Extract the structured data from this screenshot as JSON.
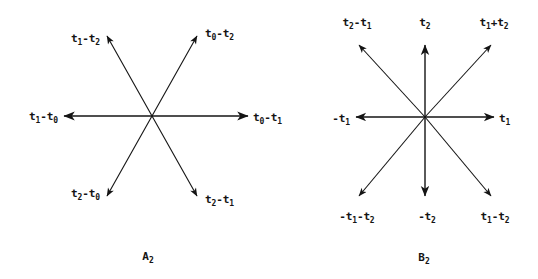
{
  "figure": {
    "background_color": "#ffffff",
    "ink_color": "#141414",
    "diagrams": [
      {
        "id": "A2",
        "caption": "A",
        "caption_sub": "2",
        "caption_full": "A₂",
        "type": "root-system-hexagonal",
        "center": {
          "x": 152,
          "y": 116
        },
        "root_count": 6,
        "roots": [
          {
            "name": "t0-t1",
            "base": "t",
            "sub1": "0",
            "op": "-",
            "base2": "t",
            "sub2": "1",
            "angle_deg": 0,
            "label_pos": "east",
            "tip": {
              "x": 251,
              "y": 116
            }
          },
          {
            "name": "t0-t2",
            "base": "t",
            "sub1": "0",
            "op": "-",
            "base2": "t",
            "sub2": "2",
            "angle_deg": 60,
            "label_pos": "north-east",
            "tip": {
              "x": 199,
              "y": 33
            }
          },
          {
            "name": "t1-t2",
            "base": "t",
            "sub1": "1",
            "op": "-",
            "base2": "t",
            "sub2": "2",
            "angle_deg": 120,
            "label_pos": "north-west",
            "tip": {
              "x": 105,
              "y": 33
            }
          },
          {
            "name": "t1-t0",
            "base": "t",
            "sub1": "1",
            "op": "-",
            "base2": "t",
            "sub2": "0",
            "angle_deg": 180,
            "label_pos": "west",
            "tip": {
              "x": 61,
              "y": 116
            }
          },
          {
            "name": "t2-t0",
            "base": "t",
            "sub1": "2",
            "op": "-",
            "base2": "t",
            "sub2": "0",
            "angle_deg": 240,
            "label_pos": "south-west",
            "tip": {
              "x": 105,
              "y": 199
            }
          },
          {
            "name": "t2-t1",
            "base": "t",
            "sub1": "2",
            "op": "-",
            "base2": "t",
            "sub2": "1",
            "angle_deg": 300,
            "label_pos": "south-east",
            "tip": {
              "x": 199,
              "y": 199
            }
          }
        ]
      },
      {
        "id": "B2",
        "caption": "B",
        "caption_sub": "2",
        "caption_full": "B₂",
        "type": "root-system-square",
        "center": {
          "x": 425,
          "y": 117
        },
        "root_count": 8,
        "roots": [
          {
            "name": "t1",
            "text_prefix": "",
            "base": "t",
            "sub1": "1",
            "op": "",
            "base2": "",
            "sub2": "",
            "angle_deg": 0,
            "label_pos": "east",
            "tip": {
              "x": 497,
              "y": 117
            }
          },
          {
            "name": "t1+t2",
            "text_prefix": "",
            "base": "t",
            "sub1": "1",
            "op": "+",
            "base2": "t",
            "sub2": "2",
            "angle_deg": 45,
            "label_pos": "north-east",
            "tip": {
              "x": 494,
              "y": 42
            }
          },
          {
            "name": "t2",
            "text_prefix": "",
            "base": "t",
            "sub1": "2",
            "op": "",
            "base2": "",
            "sub2": "",
            "angle_deg": 90,
            "label_pos": "north",
            "tip": {
              "x": 425,
              "y": 42
            }
          },
          {
            "name": "t2-t1",
            "text_prefix": "",
            "base": "t",
            "sub1": "2",
            "op": "-",
            "base2": "t",
            "sub2": "1",
            "angle_deg": 135,
            "label_pos": "north-west",
            "tip": {
              "x": 356,
              "y": 42
            }
          },
          {
            "name": "-t1",
            "text_prefix": "-",
            "base": "t",
            "sub1": "1",
            "op": "",
            "base2": "",
            "sub2": "",
            "angle_deg": 180,
            "label_pos": "west",
            "tip": {
              "x": 353,
              "y": 117
            }
          },
          {
            "name": "-t1-t2",
            "text_prefix": "-",
            "base": "t",
            "sub1": "1",
            "op": "-",
            "base2": "t",
            "sub2": "2",
            "angle_deg": 225,
            "label_pos": "south-west",
            "tip": {
              "x": 356,
              "y": 199
            }
          },
          {
            "name": "-t2",
            "text_prefix": "-",
            "base": "t",
            "sub1": "2",
            "op": "",
            "base2": "",
            "sub2": "",
            "angle_deg": 270,
            "label_pos": "south",
            "tip": {
              "x": 425,
              "y": 199
            }
          },
          {
            "name": "t1-t2",
            "text_prefix": "",
            "base": "t",
            "sub1": "1",
            "op": "-",
            "base2": "t",
            "sub2": "2",
            "angle_deg": 315,
            "label_pos": "south-east",
            "tip": {
              "x": 494,
              "y": 199
            }
          }
        ]
      }
    ]
  },
  "a2": {
    "caption_base": "A",
    "caption_sub": "2",
    "labels": {
      "t0_minus_t1": {
        "p1": "t",
        "s1": "0",
        "op": "-",
        "p2": "t",
        "s2": "1"
      },
      "t0_minus_t2": {
        "p1": "t",
        "s1": "0",
        "op": "-",
        "p2": "t",
        "s2": "2"
      },
      "t1_minus_t2": {
        "p1": "t",
        "s1": "1",
        "op": "-",
        "p2": "t",
        "s2": "2"
      },
      "t1_minus_t0": {
        "p1": "t",
        "s1": "1",
        "op": "-",
        "p2": "t",
        "s2": "0"
      },
      "t2_minus_t0": {
        "p1": "t",
        "s1": "2",
        "op": "-",
        "p2": "t",
        "s2": "0"
      },
      "t2_minus_t1": {
        "p1": "t",
        "s1": "2",
        "op": "-",
        "p2": "t",
        "s2": "1"
      }
    }
  },
  "b2": {
    "caption_base": "B",
    "caption_sub": "2",
    "labels": {
      "t1": {
        "p1": "t",
        "s1": "1",
        "op": "",
        "p2": "",
        "s2": ""
      },
      "t1_plus_t2": {
        "p1": "t",
        "s1": "1",
        "op": "+",
        "p2": "t",
        "s2": "2"
      },
      "t2": {
        "p1": "t",
        "s1": "2",
        "op": "",
        "p2": "",
        "s2": ""
      },
      "t2_minus_t1": {
        "p1": "t",
        "s1": "2",
        "op": "-",
        "p2": "t",
        "s2": "1"
      },
      "neg_t1": {
        "p1": "-t",
        "s1": "1",
        "op": "",
        "p2": "",
        "s2": ""
      },
      "neg_t1_neg_t2": {
        "p1": "-t",
        "s1": "1",
        "op": "-",
        "p2": "t",
        "s2": "2"
      },
      "neg_t2": {
        "p1": "-t",
        "s1": "2",
        "op": "",
        "p2": "",
        "s2": ""
      },
      "t1_minus_t2": {
        "p1": "t",
        "s1": "1",
        "op": "-",
        "p2": "t",
        "s2": "2"
      }
    }
  }
}
